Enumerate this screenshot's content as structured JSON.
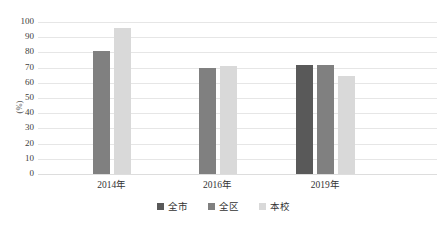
{
  "chart_data": {
    "type": "bar",
    "title": "",
    "subtitle": "",
    "xlabel": "",
    "ylabel": "(%)",
    "categories": [
      "2014年",
      "2016年",
      "2019年"
    ],
    "series": [
      {
        "name": "全市",
        "color": "#595959",
        "values": [
          null,
          null,
          72
        ]
      },
      {
        "name": "全区",
        "color": "#808080",
        "values": [
          81,
          70,
          72
        ]
      },
      {
        "name": "本校",
        "color": "#d9d9d9",
        "values": [
          96,
          71,
          64.5
        ]
      }
    ],
    "ylim": [
      0,
      100
    ],
    "yticks": [
      0,
      10,
      20,
      30,
      40,
      50,
      60,
      70,
      80,
      90,
      100
    ],
    "ytick_labels": [
      "0",
      "10",
      "20",
      "30",
      "40",
      "50",
      "60",
      "70",
      "80",
      "90",
      "100"
    ],
    "grid": "horizontal",
    "legend_position": "bottom",
    "legend_labels": [
      "全市",
      "全区",
      "本校"
    ],
    "background": "#ffffff",
    "gridline_color": "#e6e6e6"
  }
}
